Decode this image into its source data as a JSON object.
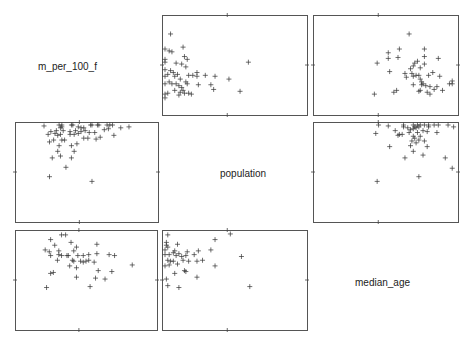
{
  "chart_data": {
    "type": "scatter",
    "title": "",
    "variables": [
      "m_per_100_f",
      "population",
      "median_age"
    ],
    "layout": {
      "rows": 3,
      "cols": 3,
      "diagonal": "labels",
      "grid": false,
      "marker": "+"
    },
    "panels": [
      {
        "row": 0,
        "col": 1,
        "x": "population",
        "y": "m_per_100_f",
        "box": [
          162,
          15,
          145,
          100
        ],
        "points": [
          [
            0.04,
            0.17
          ],
          [
            0.0,
            0.33
          ],
          [
            0.03,
            0.35
          ],
          [
            0.05,
            0.36
          ],
          [
            0.13,
            0.31
          ],
          [
            0.0,
            0.44
          ],
          [
            0.14,
            0.41
          ],
          [
            0.16,
            0.44
          ],
          [
            0.0,
            0.47
          ],
          [
            0.08,
            0.48
          ],
          [
            0.12,
            0.49
          ],
          [
            0.15,
            0.52
          ],
          [
            0.0,
            0.55
          ],
          [
            0.04,
            0.56
          ],
          [
            0.06,
            0.58
          ],
          [
            0.09,
            0.6
          ],
          [
            0.02,
            0.6
          ],
          [
            0.0,
            0.62
          ],
          [
            0.07,
            0.62
          ],
          [
            0.17,
            0.61
          ],
          [
            0.2,
            0.61
          ],
          [
            0.23,
            0.58
          ],
          [
            0.23,
            0.62
          ],
          [
            0.29,
            0.61
          ],
          [
            0.36,
            0.62
          ],
          [
            0.11,
            0.65
          ],
          [
            0.03,
            0.68
          ],
          [
            0.08,
            0.7
          ],
          [
            0.0,
            0.7
          ],
          [
            0.05,
            0.7
          ],
          [
            0.15,
            0.68
          ],
          [
            0.16,
            0.7
          ],
          [
            0.1,
            0.72
          ],
          [
            0.12,
            0.74
          ],
          [
            0.24,
            0.71
          ],
          [
            0.33,
            0.71
          ],
          [
            0.46,
            0.65
          ],
          [
            0.6,
            0.47
          ],
          [
            0.07,
            0.77
          ],
          [
            0.13,
            0.77
          ],
          [
            0.11,
            0.79
          ],
          [
            0.14,
            0.8
          ],
          [
            0.17,
            0.8
          ],
          [
            0.0,
            0.81
          ],
          [
            0.35,
            0.76
          ],
          [
            0.02,
            0.8
          ],
          [
            0.1,
            0.82
          ],
          [
            0.19,
            0.81
          ],
          [
            0.54,
            0.78
          ],
          [
            0.0,
            0.85
          ]
        ]
      },
      {
        "row": 0,
        "col": 2,
        "x": "median_age",
        "y": "m_per_100_f",
        "box": [
          313,
          15,
          145,
          100
        ],
        "points": [
          [
            0.67,
            0.17
          ],
          [
            0.6,
            0.33
          ],
          [
            0.52,
            0.37
          ],
          [
            0.78,
            0.33
          ],
          [
            0.52,
            0.43
          ],
          [
            0.59,
            0.42
          ],
          [
            0.78,
            0.41
          ],
          [
            0.73,
            0.46
          ],
          [
            0.88,
            0.43
          ],
          [
            0.44,
            0.48
          ],
          [
            0.71,
            0.48
          ],
          [
            0.78,
            0.49
          ],
          [
            0.7,
            0.51
          ],
          [
            0.68,
            0.54
          ],
          [
            0.75,
            0.53
          ],
          [
            0.53,
            0.57
          ],
          [
            0.64,
            0.59
          ],
          [
            0.69,
            0.59
          ],
          [
            0.7,
            0.62
          ],
          [
            0.72,
            0.61
          ],
          [
            0.74,
            0.61
          ],
          [
            0.81,
            0.61
          ],
          [
            0.84,
            0.58
          ],
          [
            0.89,
            0.62
          ],
          [
            0.65,
            0.63
          ],
          [
            0.75,
            0.65
          ],
          [
            0.76,
            0.68
          ],
          [
            0.77,
            0.7
          ],
          [
            0.7,
            0.71
          ],
          [
            0.76,
            0.71
          ],
          [
            0.79,
            0.72
          ],
          [
            0.82,
            0.73
          ],
          [
            0.87,
            0.73
          ],
          [
            0.98,
            0.67
          ],
          [
            0.98,
            0.7
          ],
          [
            0.96,
            0.7
          ],
          [
            0.85,
            0.76
          ],
          [
            0.91,
            0.77
          ],
          [
            0.75,
            0.77
          ],
          [
            0.74,
            0.78
          ],
          [
            0.58,
            0.77
          ],
          [
            0.56,
            0.79
          ],
          [
            0.8,
            0.79
          ],
          [
            0.82,
            0.81
          ],
          [
            0.42,
            0.81
          ]
        ]
      },
      {
        "row": 1,
        "col": 0,
        "x": "m_per_100_f",
        "y": "population",
        "box": [
          15,
          122,
          143,
          100
        ],
        "points": [
          [
            0.23,
            0.55
          ],
          [
            0.54,
            0.6
          ],
          [
            0.35,
            0.45
          ],
          [
            0.25,
            0.35
          ],
          [
            0.39,
            0.35
          ],
          [
            0.31,
            0.33
          ],
          [
            0.29,
            0.28
          ],
          [
            0.41,
            0.28
          ],
          [
            0.3,
            0.22
          ],
          [
            0.39,
            0.22
          ],
          [
            0.43,
            0.2
          ],
          [
            0.23,
            0.18
          ],
          [
            0.26,
            0.16
          ],
          [
            0.32,
            0.16
          ],
          [
            0.34,
            0.16
          ],
          [
            0.48,
            0.14
          ],
          [
            0.51,
            0.14
          ],
          [
            0.57,
            0.15
          ],
          [
            0.6,
            0.13
          ],
          [
            0.7,
            0.11
          ],
          [
            0.22,
            0.1
          ],
          [
            0.27,
            0.09
          ],
          [
            0.29,
            0.11
          ],
          [
            0.31,
            0.1
          ],
          [
            0.38,
            0.1
          ],
          [
            0.41,
            0.1
          ],
          [
            0.44,
            0.09
          ],
          [
            0.24,
            0.07
          ],
          [
            0.28,
            0.06
          ],
          [
            0.33,
            0.06
          ],
          [
            0.38,
            0.07
          ],
          [
            0.42,
            0.06
          ],
          [
            0.46,
            0.07
          ],
          [
            0.49,
            0.06
          ],
          [
            0.52,
            0.08
          ],
          [
            0.56,
            0.08
          ],
          [
            0.63,
            0.05
          ],
          [
            0.66,
            0.04
          ],
          [
            0.75,
            0.03
          ],
          [
            0.81,
            0.02
          ],
          [
            0.31,
            0.03
          ],
          [
            0.32,
            0.02
          ],
          [
            0.44,
            0.02
          ],
          [
            0.46,
            0.03
          ],
          [
            0.48,
            0.03
          ],
          [
            0.19,
            0.01
          ],
          [
            0.3,
            0.0
          ],
          [
            0.32,
            0.0
          ],
          [
            0.39,
            0.0
          ],
          [
            0.4,
            0.0
          ],
          [
            0.53,
            0.0
          ],
          [
            0.54,
            0.0
          ],
          [
            0.58,
            0.0
          ],
          [
            0.59,
            0.0
          ],
          [
            0.65,
            0.0
          ],
          [
            0.67,
            0.0
          ],
          [
            0.69,
            0.0
          ]
        ]
      },
      {
        "row": 1,
        "col": 2,
        "x": "median_age",
        "y": "population",
        "box": [
          313,
          122,
          145,
          100
        ],
        "points": [
          [
            0.44,
            0.6
          ],
          [
            0.74,
            0.55
          ],
          [
            0.98,
            0.46
          ],
          [
            0.64,
            0.35
          ],
          [
            0.93,
            0.35
          ],
          [
            0.77,
            0.32
          ],
          [
            0.7,
            0.28
          ],
          [
            0.53,
            0.23
          ],
          [
            0.8,
            0.23
          ],
          [
            0.68,
            0.22
          ],
          [
            0.72,
            0.19
          ],
          [
            0.78,
            0.17
          ],
          [
            0.69,
            0.17
          ],
          [
            0.71,
            0.14
          ],
          [
            0.74,
            0.16
          ],
          [
            0.59,
            0.11
          ],
          [
            0.6,
            0.1
          ],
          [
            0.62,
            0.1
          ],
          [
            0.7,
            0.12
          ],
          [
            0.75,
            0.12
          ],
          [
            0.73,
            0.08
          ],
          [
            0.67,
            0.08
          ],
          [
            0.43,
            0.09
          ],
          [
            0.57,
            0.06
          ],
          [
            0.77,
            0.06
          ],
          [
            0.8,
            0.07
          ],
          [
            0.87,
            0.08
          ],
          [
            0.68,
            0.05
          ],
          [
            0.7,
            0.04
          ],
          [
            0.66,
            0.03
          ],
          [
            0.71,
            0.02
          ],
          [
            0.72,
            0.03
          ],
          [
            0.63,
            0.02
          ],
          [
            0.74,
            0.02
          ],
          [
            0.81,
            0.02
          ],
          [
            0.45,
            0.0
          ],
          [
            0.52,
            0.01
          ],
          [
            0.63,
            0.0
          ],
          [
            0.7,
            0.0
          ],
          [
            0.73,
            0.0
          ],
          [
            0.75,
            0.0
          ],
          [
            0.78,
            0.0
          ],
          [
            0.81,
            0.0
          ],
          [
            0.85,
            0.0
          ],
          [
            0.88,
            0.0
          ],
          [
            0.95,
            0.0
          ],
          [
            0.99,
            0.02
          ]
        ]
      },
      {
        "row": 2,
        "col": 0,
        "x": "m_per_100_f",
        "y": "median_age",
        "box": [
          15,
          230,
          142,
          100
        ],
        "points": [
          [
            0.32,
            0.02
          ],
          [
            0.35,
            0.02
          ],
          [
            0.24,
            0.07
          ],
          [
            0.39,
            0.1
          ],
          [
            0.27,
            0.13
          ],
          [
            0.43,
            0.15
          ],
          [
            0.2,
            0.18
          ],
          [
            0.23,
            0.2
          ],
          [
            0.3,
            0.19
          ],
          [
            0.41,
            0.19
          ],
          [
            0.58,
            0.12
          ],
          [
            0.24,
            0.24
          ],
          [
            0.3,
            0.23
          ],
          [
            0.32,
            0.24
          ],
          [
            0.36,
            0.24
          ],
          [
            0.37,
            0.24
          ],
          [
            0.44,
            0.24
          ],
          [
            0.48,
            0.24
          ],
          [
            0.52,
            0.23
          ],
          [
            0.58,
            0.22
          ],
          [
            0.67,
            0.23
          ],
          [
            0.71,
            0.24
          ],
          [
            0.29,
            0.29
          ],
          [
            0.4,
            0.29
          ],
          [
            0.41,
            0.3
          ],
          [
            0.46,
            0.3
          ],
          [
            0.48,
            0.31
          ],
          [
            0.5,
            0.3
          ],
          [
            0.52,
            0.29
          ],
          [
            0.56,
            0.31
          ],
          [
            0.84,
            0.34
          ],
          [
            0.38,
            0.35
          ],
          [
            0.43,
            0.37
          ],
          [
            0.59,
            0.4
          ],
          [
            0.69,
            0.41
          ],
          [
            0.24,
            0.43
          ],
          [
            0.26,
            0.42
          ],
          [
            0.43,
            0.47
          ],
          [
            0.57,
            0.48
          ],
          [
            0.64,
            0.49
          ],
          [
            0.53,
            0.57
          ],
          [
            0.21,
            0.58
          ]
        ]
      },
      {
        "row": 2,
        "col": 1,
        "x": "population",
        "y": "median_age",
        "box": [
          162,
          230,
          145,
          100
        ],
        "points": [
          [
            0.02,
            0.02
          ],
          [
            0.47,
            0.01
          ],
          [
            0.36,
            0.07
          ],
          [
            0.01,
            0.1
          ],
          [
            0.01,
            0.13
          ],
          [
            0.02,
            0.15
          ],
          [
            0.09,
            0.12
          ],
          [
            0.0,
            0.18
          ],
          [
            0.07,
            0.19
          ],
          [
            0.06,
            0.21
          ],
          [
            0.24,
            0.19
          ],
          [
            0.33,
            0.18
          ],
          [
            0.1,
            0.22
          ],
          [
            0.03,
            0.23
          ],
          [
            0.16,
            0.2
          ],
          [
            0.0,
            0.23
          ],
          [
            0.08,
            0.24
          ],
          [
            0.12,
            0.25
          ],
          [
            0.15,
            0.24
          ],
          [
            0.21,
            0.23
          ],
          [
            0.55,
            0.25
          ],
          [
            0.02,
            0.29
          ],
          [
            0.04,
            0.3
          ],
          [
            0.06,
            0.3
          ],
          [
            0.13,
            0.29
          ],
          [
            0.17,
            0.3
          ],
          [
            0.23,
            0.3
          ],
          [
            0.27,
            0.29
          ],
          [
            0.0,
            0.35
          ],
          [
            0.03,
            0.34
          ],
          [
            0.09,
            0.33
          ],
          [
            0.14,
            0.4
          ],
          [
            0.15,
            0.41
          ],
          [
            0.07,
            0.43
          ],
          [
            0.36,
            0.35
          ],
          [
            0.23,
            0.47
          ],
          [
            0.01,
            0.49
          ],
          [
            0.02,
            0.56
          ],
          [
            0.1,
            0.58
          ],
          [
            0.61,
            0.57
          ]
        ]
      }
    ]
  },
  "diagonal_labels": {
    "m_per_100_f": "m_per_100_f",
    "population": "population",
    "median_age": "median_age"
  }
}
